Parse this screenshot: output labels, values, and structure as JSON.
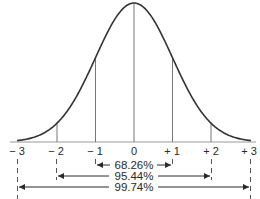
{
  "diagram": {
    "type": "normal-distribution",
    "title": "",
    "colors": {
      "curve": "#333333",
      "lines": "#777777",
      "text": "#2a2a2a"
    },
    "axis": {
      "ticks": [
        {
          "sd": -3,
          "label": "− 3"
        },
        {
          "sd": -2,
          "label": "− 2"
        },
        {
          "sd": -1,
          "label": "− 1"
        },
        {
          "sd": 0,
          "label": "0"
        },
        {
          "sd": 1,
          "label": "+ 1"
        },
        {
          "sd": 2,
          "label": "+ 2"
        },
        {
          "sd": 3,
          "label": "+ 3"
        }
      ]
    },
    "ranges": [
      {
        "from": -1,
        "to": 1,
        "label": "68.26%"
      },
      {
        "from": -2,
        "to": 2,
        "label": "95.44%"
      },
      {
        "from": -3,
        "to": 3,
        "label": "99.74%"
      }
    ]
  }
}
